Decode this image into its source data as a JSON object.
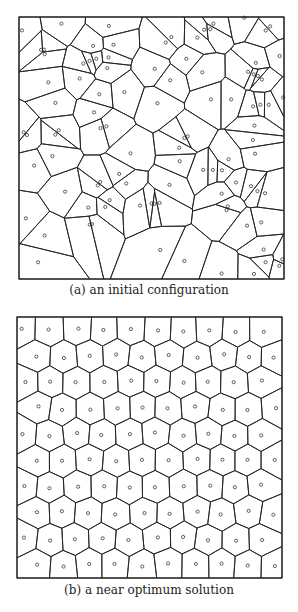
{
  "figures": [
    {
      "id": "a",
      "caption": "(a) an initial configuration",
      "description": "Voronoi diagram of randomly placed points"
    },
    {
      "id": "b",
      "caption": "(b) a near optimum solution",
      "description": "Voronoi diagram of near-uniform points (centroidal)"
    }
  ],
  "colors": {
    "line": "#222222",
    "background": "#ffffff"
  }
}
